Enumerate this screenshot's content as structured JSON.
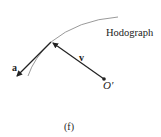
{
  "diagram": {
    "labels": {
      "curve": "Hodograph",
      "acceleration": "a",
      "velocity": "v",
      "origin": "O′",
      "caption": "(f)"
    },
    "colors": {
      "curve": "#9a9a9a",
      "vectors": "#222222"
    }
  }
}
